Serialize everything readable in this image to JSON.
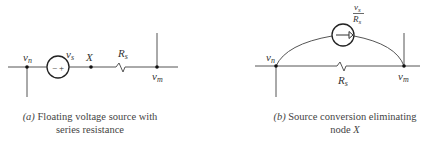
{
  "diagram_a": {
    "labels": {
      "vn_main": "v",
      "vn_sub": "n",
      "vs_main": "v",
      "vs_sub": "s",
      "x": "X",
      "rs_main": "R",
      "rs_sub": "s",
      "vm_main": "v",
      "vm_sub": "m"
    },
    "source_signs": {
      "minus": "−",
      "plus": "+"
    },
    "caption_tag": "(a)",
    "caption_line1": "Floating voltage source with",
    "caption_line2": "series resistance"
  },
  "diagram_b": {
    "labels": {
      "vn_main": "v",
      "vn_sub": "n",
      "rs_main": "R",
      "rs_sub": "s",
      "vm_main": "v",
      "vm_sub": "m",
      "frac_num_main": "v",
      "frac_num_sub": "s",
      "frac_den_main": "R",
      "frac_den_sub": "s"
    },
    "caption_tag": "(b)",
    "caption_line1": "Source conversion eliminating",
    "caption_line2_prefix": "node ",
    "caption_line2_var": "X"
  },
  "colors": {
    "line": "#555555",
    "node": "#111111",
    "text": "#333333"
  }
}
